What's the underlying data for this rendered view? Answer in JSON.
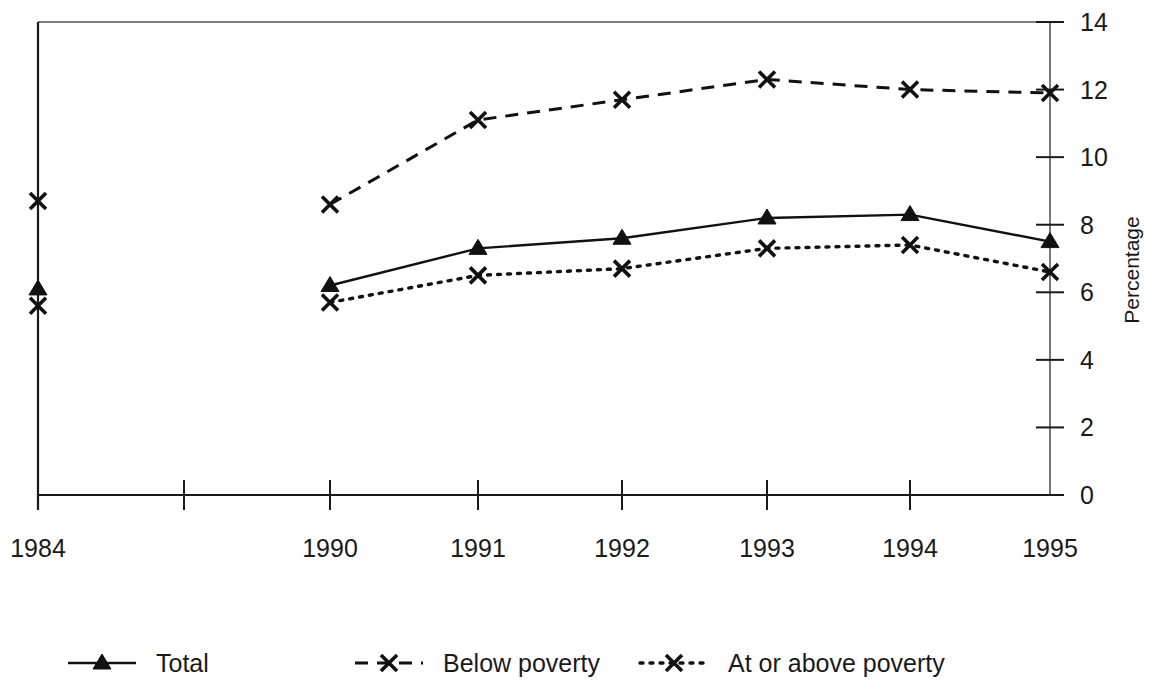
{
  "chart_data": {
    "type": "line",
    "title": "",
    "xlabel": "",
    "ylabel": "Percentage",
    "ylim": [
      0,
      14
    ],
    "yticks": [
      0,
      2,
      4,
      6,
      8,
      10,
      12,
      14
    ],
    "ytick_labels": [
      "0",
      "2",
      "4",
      "6",
      "8",
      "10",
      "12",
      "14"
    ],
    "x": [
      "1984",
      "",
      "1990",
      "1991",
      "1992",
      "1993",
      "1994",
      "1995"
    ],
    "xtick_labels": [
      "1984",
      "",
      "1990",
      "1991",
      "1992",
      "1993",
      "1994",
      "1995"
    ],
    "grid": false,
    "legend_position": "bottom",
    "series": [
      {
        "name": "Total",
        "marker": "triangle",
        "linestyle": "solid",
        "color": "#111111",
        "points": [
          {
            "x": "1984",
            "value": 6.1
          },
          {
            "x": "1990",
            "value": 6.2
          },
          {
            "x": "1991",
            "value": 7.3
          },
          {
            "x": "1992",
            "value": 7.6
          },
          {
            "x": "1993",
            "value": 8.2
          },
          {
            "x": "1994",
            "value": 8.3
          },
          {
            "x": "1995",
            "value": 7.5
          }
        ]
      },
      {
        "name": "Below poverty",
        "marker": "x",
        "linestyle": "dashed",
        "color": "#111111",
        "points": [
          {
            "x": "1984",
            "value": 8.7
          },
          {
            "x": "1990",
            "value": 8.6
          },
          {
            "x": "1991",
            "value": 11.1
          },
          {
            "x": "1992",
            "value": 11.7
          },
          {
            "x": "1993",
            "value": 12.3
          },
          {
            "x": "1994",
            "value": 12.0
          },
          {
            "x": "1995",
            "value": 11.9
          }
        ]
      },
      {
        "name": "At or above poverty",
        "marker": "x",
        "linestyle": "dotted",
        "color": "#111111",
        "points": [
          {
            "x": "1984",
            "value": 5.6
          },
          {
            "x": "1990",
            "value": 5.7
          },
          {
            "x": "1991",
            "value": 6.5
          },
          {
            "x": "1992",
            "value": 6.7
          },
          {
            "x": "1993",
            "value": 7.3
          },
          {
            "x": "1994",
            "value": 7.4
          },
          {
            "x": "1995",
            "value": 6.6
          }
        ]
      }
    ]
  },
  "legend": {
    "items": [
      {
        "label": "Total",
        "style": "solid-triangle"
      },
      {
        "label": "Below poverty",
        "style": "dashed-x"
      },
      {
        "label": "At or above poverty",
        "style": "dotted-x"
      }
    ]
  },
  "axis": {
    "y_title": "Percentage"
  }
}
